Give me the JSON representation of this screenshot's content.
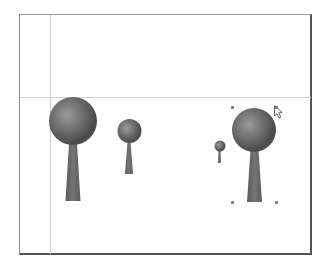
{
  "canvas": {
    "frame": {
      "x": 19,
      "y": 14,
      "width": 294,
      "height": 243
    },
    "guides": {
      "vertical_x": 50,
      "horizontal_y": 97,
      "color": "#d0d0d0"
    }
  },
  "objects": [
    {
      "name": "tree-1",
      "crown": {
        "cx": 73,
        "cy": 121,
        "r": 24
      },
      "trunk": {
        "top_y": 144,
        "bottom_y": 201,
        "top_w": 8,
        "bottom_w": 15,
        "cx": 73
      },
      "selected": false
    },
    {
      "name": "tree-2",
      "crown": {
        "cx": 129.5,
        "cy": 131,
        "r": 12
      },
      "trunk": {
        "top_y": 142,
        "bottom_y": 174,
        "top_w": 3,
        "bottom_w": 8,
        "cx": 129
      },
      "selected": false
    },
    {
      "name": "tree-3",
      "crown": {
        "cx": 220,
        "cy": 146,
        "r": 5.5
      },
      "trunk": {
        "top_y": 150,
        "bottom_y": 163,
        "top_w": 2,
        "bottom_w": 3,
        "cx": 219.5
      },
      "selected": false
    },
    {
      "name": "tree-4",
      "crown": {
        "cx": 254,
        "cy": 130,
        "r": 22
      },
      "trunk": {
        "top_y": 150,
        "bottom_y": 202,
        "top_w": 8,
        "bottom_w": 15,
        "cx": 254.5
      },
      "selected": true
    }
  ],
  "selection": {
    "handles": [
      {
        "x": 232,
        "y": 107
      },
      {
        "x": 276,
        "y": 107
      },
      {
        "x": 232,
        "y": 202
      },
      {
        "x": 276,
        "y": 202
      }
    ]
  },
  "cursor": {
    "icon": "arrow-pointer-icon",
    "x": 274,
    "y": 105
  },
  "colors": {
    "crown_light": "#9a9a9a",
    "crown_mid": "#6f6f6f",
    "crown_dark": "#454545",
    "trunk": "#6a6a6a",
    "frame_dark": "#555555",
    "guide": "#d0d0d0",
    "handle": "#7a7a7a"
  }
}
